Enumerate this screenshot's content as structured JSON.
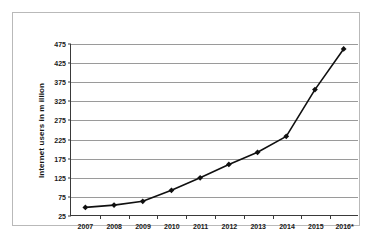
{
  "chart_data": {
    "type": "line",
    "title": "",
    "xlabel": "",
    "ylabel": "Internet users in m illion",
    "categories": [
      "2007",
      "2008",
      "2009",
      "2010",
      "2011",
      "2012",
      "2013",
      "2014",
      "2015",
      "2016*"
    ],
    "values": [
      45,
      51,
      61,
      90,
      123,
      158,
      190,
      232,
      355,
      462
    ],
    "series": [
      {
        "name": "Internet users",
        "values": [
          45,
          51,
          61,
          90,
          123,
          158,
          190,
          232,
          355,
          462
        ]
      }
    ],
    "ylim": [
      25,
      475
    ],
    "yticks": [
      25,
      75,
      125,
      175,
      225,
      275,
      325,
      375,
      425,
      475
    ],
    "ytick_labels": [
      "25",
      "75",
      "125",
      "175",
      "225",
      "275",
      "325",
      "375",
      "425",
      "475"
    ],
    "grid": true,
    "legend": false,
    "legend_position": "none",
    "marker": "diamond",
    "line_color": "#101010",
    "marker_color": "#101010",
    "grid_color": "#9a9a9a",
    "axis_color": "#3a3a3a",
    "background_color": "#ffffff",
    "frame_color": "#b9b9b9",
    "annotations": [
      "* indicates a projected or estimated value for 2016"
    ]
  }
}
